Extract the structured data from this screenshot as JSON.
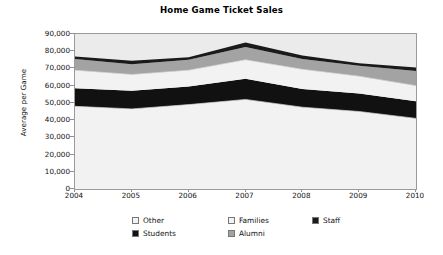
{
  "chart": {
    "title": "Home Game Ticket Sales",
    "ylabel": "Average per Game"
  },
  "axis": {
    "y_ticks": [
      "90,000",
      "80,000",
      "70,000",
      "60,000",
      "50,000",
      "40,000",
      "30,000",
      "20,000",
      "10,000",
      "0"
    ],
    "x_ticks": [
      "2004",
      "2005",
      "2006",
      "2007",
      "2008",
      "2009",
      "2010"
    ]
  },
  "legend": {
    "items": [
      {
        "label": "Other",
        "color": "#f2f2f2"
      },
      {
        "label": "Families",
        "color": "#f2f2f2"
      },
      {
        "label": "Staff",
        "color": "#1a1a1a"
      },
      {
        "label": "Students",
        "color": "#111111"
      },
      {
        "label": "Alumni",
        "color": "#a3a3a3"
      }
    ]
  },
  "chart_data": {
    "type": "area",
    "title": "Home Game Ticket Sales",
    "subtitle": "",
    "xlabel": "",
    "ylabel": "Average per Game",
    "stacked": true,
    "grid": false,
    "legend_position": "bottom",
    "ylim": [
      0,
      90000
    ],
    "ytick_values": [
      0,
      10000,
      20000,
      30000,
      40000,
      50000,
      60000,
      70000,
      80000,
      90000
    ],
    "categories": [
      "2004",
      "2005",
      "2006",
      "2007",
      "2008",
      "2009",
      "2010"
    ],
    "series": [
      {
        "name": "Other",
        "color": "#f2f2f2",
        "values": [
          48000,
          46500,
          49000,
          52000,
          47500,
          45000,
          41000
        ]
      },
      {
        "name": "Students",
        "color": "#111111",
        "values": [
          10500,
          10500,
          10500,
          12000,
          10500,
          10500,
          10000
        ]
      },
      {
        "name": "Families",
        "color": "#f2f2f2",
        "values": [
          10500,
          9500,
          9500,
          11000,
          11500,
          10000,
          9000
        ]
      },
      {
        "name": "Alumni",
        "color": "#a3a3a3",
        "values": [
          6500,
          6000,
          6000,
          7500,
          6000,
          6000,
          8500
        ]
      },
      {
        "name": "Staff",
        "color": "#1a1a1a",
        "values": [
          1500,
          2000,
          1500,
          2500,
          2000,
          1500,
          2000
        ]
      }
    ],
    "cumulative_tops": {
      "Other": [
        48000,
        46500,
        49000,
        52000,
        47500,
        45000,
        41000
      ],
      "Students": [
        58500,
        57000,
        59500,
        64000,
        58000,
        55500,
        51000
      ],
      "Families": [
        69000,
        66500,
        69000,
        75000,
        69500,
        65500,
        60000
      ],
      "Alumni": [
        75500,
        72500,
        75000,
        82500,
        75500,
        71500,
        68500
      ],
      "Staff": [
        77000,
        74500,
        76500,
        85000,
        77500,
        73000,
        70500
      ]
    },
    "totals": [
      77000,
      74500,
      76500,
      85000,
      77500,
      73000,
      70500
    ]
  }
}
